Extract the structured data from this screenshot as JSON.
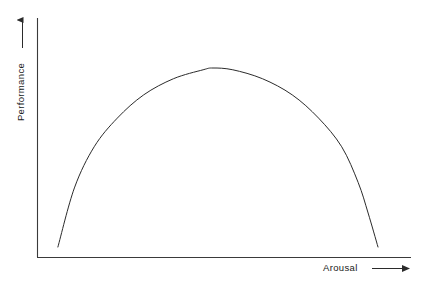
{
  "chart_data": {
    "type": "line",
    "title": "",
    "subtitle": "",
    "xlabel": "Arousal",
    "ylabel": "Performance",
    "annotations": [],
    "legend": [],
    "legend_position": "none",
    "grid": false,
    "axis_style": "open-L-with-arrows",
    "x_axis_arrow": true,
    "y_axis_arrow": true,
    "xlim": [
      0,
      1
    ],
    "ylim": [
      0,
      1
    ],
    "xticks": [],
    "yticks": [],
    "xticklabels": [],
    "yticklabels": [],
    "series": [
      {
        "name": "Inverted-U performance curve",
        "x": [
          0.03,
          0.08,
          0.14,
          0.21,
          0.29,
          0.38,
          0.47,
          0.5,
          0.56,
          0.65,
          0.74,
          0.82,
          0.89,
          0.94,
          0.97,
          1.0
        ],
        "y": [
          0.0,
          0.33,
          0.56,
          0.72,
          0.85,
          0.94,
          0.99,
          1.0,
          0.99,
          0.94,
          0.85,
          0.72,
          0.56,
          0.36,
          0.19,
          0.0
        ]
      }
    ],
    "curve_shape": "inverted U (symmetric arch)",
    "line_color": "#2b2b2b",
    "line_width": 1,
    "background_color": "#ffffff"
  },
  "labels": {
    "y_axis": "Performance",
    "x_axis": "Arousal"
  },
  "colors": {
    "background": "#ffffff",
    "axis": "#3a3a3a",
    "curve": "#2b2b2b",
    "text": "#1a1a1a"
  },
  "icons": {
    "y_axis_arrow": "arrow-up-icon",
    "x_axis_arrow": "arrow-right-icon",
    "y_label_arrow": "arrow-up-icon",
    "x_label_arrow": "arrow-right-icon"
  }
}
